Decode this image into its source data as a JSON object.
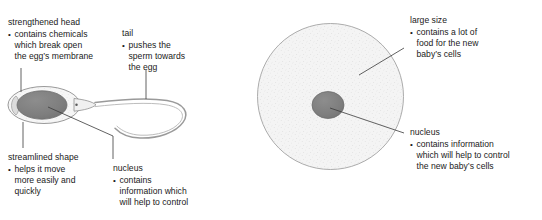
{
  "figure": {
    "title_partial": "",
    "colors": {
      "ink": "#1a1a1a",
      "outline": "#8c8c8c",
      "nucleus_fill": "#7f7f7f",
      "nucleus_stroke": "#6e6e6e",
      "cell_fill": "#f2f2f2",
      "leader": "#3a3a3a",
      "background": "#ffffff"
    }
  },
  "sperm": {
    "diagram_name": "sperm-cell-diagram",
    "notes": {
      "head": {
        "heading": "strengthened head",
        "bullets": [
          {
            "line1": "contains chemicals",
            "line2": "which break open",
            "line3": "the egg’s membrane"
          }
        ]
      },
      "tail": {
        "heading": "tail",
        "bullets": [
          {
            "line1": "pushes the",
            "line2": "sperm towards",
            "line3": "the egg"
          }
        ]
      },
      "streamlined": {
        "heading": "streamlined shape",
        "bullets": [
          {
            "line1": "helps it move",
            "line2": "more easily and",
            "line3": "quickly"
          }
        ]
      },
      "nucleus": {
        "heading": "nucleus",
        "bullets": [
          {
            "line1": "contains",
            "line2": "information which",
            "line3": "will help to control"
          }
        ]
      }
    }
  },
  "egg": {
    "diagram_name": "egg-cell-diagram",
    "notes": {
      "large_size": {
        "heading": "large size",
        "bullets": [
          {
            "line1": "contains a lot of",
            "line2": "food for the new",
            "line3": "baby’s cells"
          }
        ]
      },
      "nucleus": {
        "heading": "nucleus",
        "bullets": [
          {
            "line1": "contains information",
            "line2": "which will help to control",
            "line3": "the new baby’s cells"
          }
        ]
      }
    }
  }
}
